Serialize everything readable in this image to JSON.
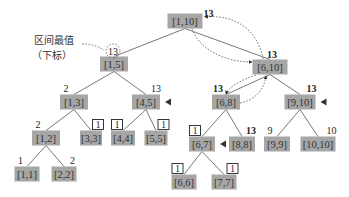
{
  "diagram": {
    "type": "segment-tree",
    "annotation": {
      "line1": "区间最值",
      "line2": "（下标）",
      "points_to_node": "[1,5]"
    },
    "nodes": [
      {
        "id": "n1_10",
        "label": "[1,10]",
        "value": "13",
        "value_style": "bold",
        "cx": 185,
        "cy": 21,
        "w": 35
      },
      {
        "id": "n1_5",
        "label": "[1,5]",
        "value": "13",
        "value_style": "circled",
        "cx": 114,
        "cy": 64,
        "w": 28
      },
      {
        "id": "n6_10",
        "label": "[6,10]",
        "value": "13",
        "value_style": "bold",
        "cx": 270,
        "cy": 67,
        "w": 35
      },
      {
        "id": "n1_3",
        "label": "[1,3]",
        "value": "2",
        "value_style": "plain",
        "cx": 74,
        "cy": 102,
        "w": 28
      },
      {
        "id": "n4_5",
        "label": "[4,5]",
        "value": "13",
        "value_style": "plain",
        "cx": 146,
        "cy": 102,
        "w": 28,
        "marker": true
      },
      {
        "id": "n6_8",
        "label": "[6,8]",
        "value": "13",
        "value_style": "bold",
        "cx": 226,
        "cy": 102,
        "w": 28
      },
      {
        "id": "n9_10",
        "label": "[9,10]",
        "value": "13",
        "value_style": "bold",
        "cx": 300,
        "cy": 102,
        "w": 31,
        "marker": true
      },
      {
        "id": "n1_2",
        "label": "[1,2]",
        "value": "2",
        "value_style": "plain",
        "cx": 46,
        "cy": 138,
        "w": 28
      },
      {
        "id": "n3_3",
        "label": "[3,3]",
        "value": "1",
        "value_style": "boxed",
        "cx": 91,
        "cy": 138,
        "w": 22
      },
      {
        "id": "n4_4",
        "label": "[4,4]",
        "value": "1",
        "value_style": "boxed",
        "cx": 123,
        "cy": 138,
        "w": 24
      },
      {
        "id": "n5_5",
        "label": "[5,5]",
        "value": "1",
        "value_style": "boxed",
        "cx": 156,
        "cy": 138,
        "w": 23
      },
      {
        "id": "n6_7",
        "label": "[6,7]",
        "value": "1",
        "value_style": "boxed",
        "cx": 202,
        "cy": 144,
        "w": 26,
        "marker": true
      },
      {
        "id": "n8_8",
        "label": "[8,8]",
        "value": "13",
        "value_style": "bold",
        "cx": 242,
        "cy": 144,
        "w": 26
      },
      {
        "id": "n9_9",
        "label": "[9,9]",
        "value": "9",
        "value_style": "plain",
        "cx": 277,
        "cy": 144,
        "w": 26
      },
      {
        "id": "n10_10",
        "label": "[10,10]",
        "value": "10",
        "value_style": "plain",
        "cx": 318,
        "cy": 144,
        "w": 35
      },
      {
        "id": "n1_1",
        "label": "[1,1]",
        "value": "1",
        "value_style": "plain",
        "cx": 27,
        "cy": 174,
        "w": 25
      },
      {
        "id": "n2_2",
        "label": "[2,2]",
        "value": "2",
        "value_style": "plain",
        "cx": 64,
        "cy": 174,
        "w": 25
      },
      {
        "id": "n6_6",
        "label": "[6,6]",
        "value": "1",
        "value_style": "boxed",
        "cx": 184,
        "cy": 182,
        "w": 25
      },
      {
        "id": "n7_7",
        "label": "[7,7]",
        "value": "1",
        "value_style": "boxed",
        "cx": 224,
        "cy": 182,
        "w": 25
      }
    ],
    "edges": [
      [
        "[1,10]",
        "[1,5]"
      ],
      [
        "[1,10]",
        "[6,10]"
      ],
      [
        "[1,5]",
        "[1,3]"
      ],
      [
        "[1,5]",
        "[4,5]"
      ],
      [
        "[6,10]",
        "[6,8]"
      ],
      [
        "[6,10]",
        "[9,10]"
      ],
      [
        "[1,3]",
        "[1,2]"
      ],
      [
        "[1,3]",
        "[3,3]"
      ],
      [
        "[4,5]",
        "[4,4]"
      ],
      [
        "[4,5]",
        "[5,5]"
      ],
      [
        "[6,8]",
        "[6,7]"
      ],
      [
        "[6,8]",
        "[8,8]"
      ],
      [
        "[9,10]",
        "[9,9]"
      ],
      [
        "[9,10]",
        "[10,10]"
      ],
      [
        "[1,2]",
        "[1,1]"
      ],
      [
        "[1,2]",
        "[2,2]"
      ],
      [
        "[6,7]",
        "[6,6]"
      ],
      [
        "[6,7]",
        "[7,7]"
      ]
    ],
    "query_path_arrows": [
      {
        "from": "[1,10]",
        "to": "[6,10]",
        "style": "dashed-curve"
      },
      {
        "from": "[6,10]",
        "to": "[1,10]",
        "style": "dashed-curve"
      },
      {
        "from": "[6,10]",
        "to": "[6,8]",
        "style": "dashed-curve"
      },
      {
        "from": "[6,8]",
        "to": "[6,10]",
        "style": "dashed-curve"
      }
    ],
    "colors": {
      "node_fill": "#a6a6a6",
      "text": "#333333",
      "edge": "#555555",
      "background": "#ffffff"
    }
  }
}
